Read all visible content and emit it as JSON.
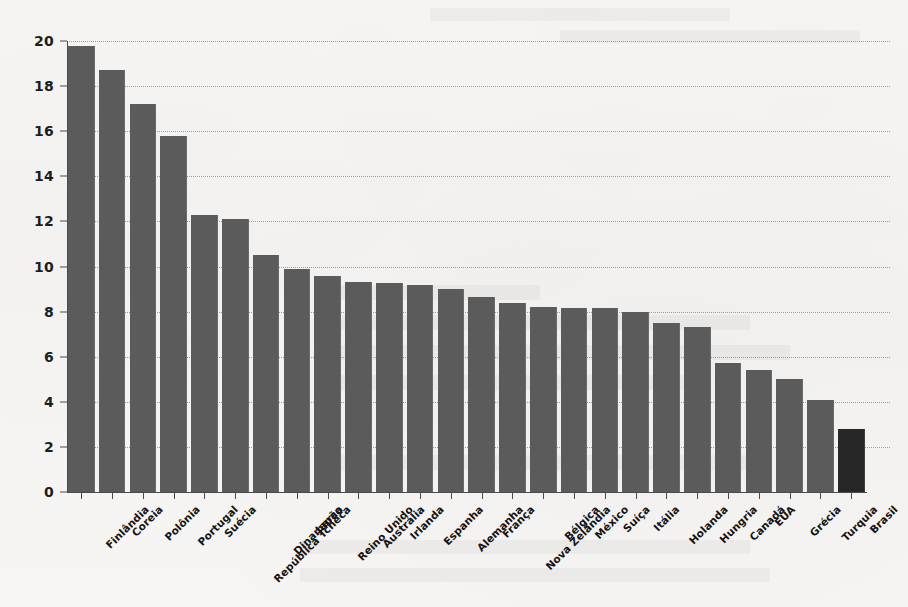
{
  "chart_data": {
    "type": "bar",
    "title": "",
    "subtitle": "",
    "xlabel": "",
    "ylabel": "",
    "ylim": [
      0,
      20
    ],
    "ytick_step": 2,
    "yticks": [
      0,
      2,
      4,
      6,
      8,
      10,
      12,
      14,
      16,
      18,
      20
    ],
    "grid": "horizontal-dotted",
    "legend": "none",
    "bar_color": "#5b5b5b",
    "highlight_color": "#272727",
    "highlight_category": "Brasil",
    "categories": [
      "Finlândia",
      "Coreia",
      "Polônia",
      "Portugal",
      "Suécia",
      "República Tcheca",
      "Dinamarca",
      "Japão",
      "Reino Unido",
      "Austrália",
      "Irlanda",
      "Espanha",
      "Alemanha",
      "França",
      "Nova Zelândia",
      "Bélgica",
      "México",
      "Suíça",
      "Itália",
      "Holanda",
      "Hungria",
      "Canadá",
      "EUA",
      "Grécia",
      "Turquia",
      "Brasil"
    ],
    "values": [
      19.8,
      18.7,
      17.2,
      15.8,
      12.3,
      12.1,
      10.5,
      9.9,
      9.6,
      9.3,
      9.25,
      9.2,
      9.0,
      8.65,
      8.4,
      8.2,
      8.15,
      8.15,
      8.0,
      7.5,
      7.3,
      5.7,
      5.4,
      5.0,
      4.1,
      2.8
    ]
  }
}
